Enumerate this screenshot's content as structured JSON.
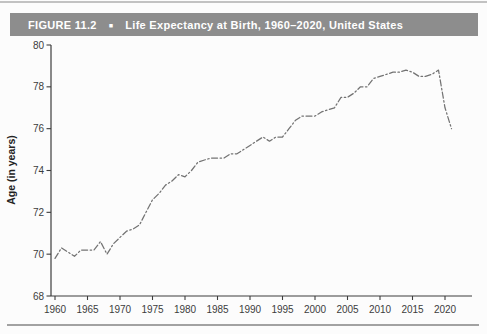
{
  "figure": {
    "label": "FIGURE 11.2",
    "marker": "■",
    "title": "Life Expectancy at Birth, 1960–2020, United States"
  },
  "chart_data": {
    "type": "line",
    "title": "Life Expectancy at Birth, 1960–2020, United States",
    "xlabel": "",
    "ylabel": "Age (in years)",
    "ylim": [
      68,
      80
    ],
    "xlim": [
      1960,
      2022
    ],
    "yticks": [
      68,
      70,
      72,
      74,
      76,
      78,
      80
    ],
    "xticks": [
      1960,
      1965,
      1970,
      1975,
      1980,
      1985,
      1990,
      1995,
      2000,
      2005,
      2010,
      2015,
      2020
    ],
    "grid": false,
    "legend": "none",
    "line_style": "dash-dot",
    "x": [
      1960,
      1961,
      1962,
      1963,
      1964,
      1965,
      1966,
      1967,
      1968,
      1969,
      1970,
      1971,
      1972,
      1973,
      1974,
      1975,
      1976,
      1977,
      1978,
      1979,
      1980,
      1981,
      1982,
      1983,
      1984,
      1985,
      1986,
      1987,
      1988,
      1989,
      1990,
      1991,
      1992,
      1993,
      1994,
      1995,
      1996,
      1997,
      1998,
      1999,
      2000,
      2001,
      2002,
      2003,
      2004,
      2005,
      2006,
      2007,
      2008,
      2009,
      2010,
      2011,
      2012,
      2013,
      2014,
      2015,
      2016,
      2017,
      2018,
      2019,
      2020,
      2021
    ],
    "values": [
      69.8,
      70.3,
      70.1,
      69.9,
      70.2,
      70.2,
      70.2,
      70.6,
      70.0,
      70.5,
      70.8,
      71.1,
      71.2,
      71.4,
      72.0,
      72.6,
      72.9,
      73.3,
      73.5,
      73.8,
      73.7,
      74.0,
      74.4,
      74.5,
      74.6,
      74.6,
      74.6,
      74.8,
      74.8,
      75.0,
      75.2,
      75.4,
      75.6,
      75.4,
      75.6,
      75.6,
      76.0,
      76.4,
      76.6,
      76.6,
      76.6,
      76.8,
      76.9,
      77.0,
      77.5,
      77.5,
      77.7,
      78.0,
      78.0,
      78.4,
      78.5,
      78.6,
      78.7,
      78.7,
      78.8,
      78.7,
      78.5,
      78.5,
      78.6,
      78.8,
      77.0,
      76.0
    ]
  },
  "colors": {
    "header_bg": "#8d8d8d",
    "header_text": "#ffffff",
    "axis": "#3c3c3c",
    "tick_label": "#3c3c3c",
    "line": "#737373",
    "rule": "#a2a2a2",
    "background": "#fcfcfc"
  }
}
